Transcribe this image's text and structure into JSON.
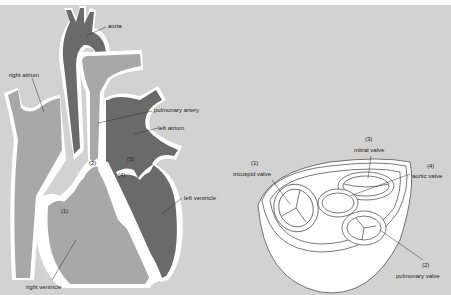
{
  "colors": {
    "background": "#d2d2d2",
    "top_band": "#ffffff",
    "light_chamber": "#a8a8a8",
    "dark_chamber": "#6a6a6a",
    "wall": "#ffffff",
    "outline": "#222222"
  },
  "heart_section": {
    "labels": {
      "aorta": "aorta",
      "right_atrium": "right atrium",
      "pulmonary_artery": "pulmonary artery",
      "left_atrium": "left atrium",
      "left_ventricle": "left ventricle",
      "right_ventricle": "right ventricle",
      "valve_1": "(1)",
      "valve_2": "(2)",
      "valve_3": "(3)",
      "valve_4": "(4)"
    }
  },
  "valve_view": {
    "labels": {
      "n3": "(3)",
      "mitral": "mitral valve",
      "n1": "(1)",
      "tricuspid": "tricuspid valve",
      "n4": "(4)",
      "aortic": "aortic valve",
      "n2": "(2)",
      "pulmonary": "pulmonary valve"
    }
  }
}
